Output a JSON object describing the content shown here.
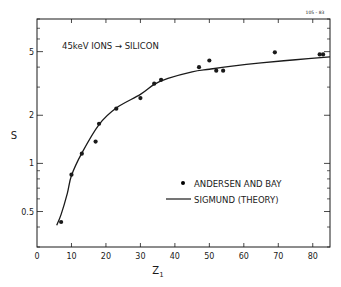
{
  "figure_id": "105 - 83",
  "chart_data": {
    "type": "scatter",
    "title": "45keV IONS → SILICON",
    "xlabel": "Z1",
    "ylabel": "S",
    "xlim": [
      0,
      85
    ],
    "ylim": [
      0.3,
      8
    ],
    "yscale": "log",
    "grid": false,
    "legend_position": "lower right",
    "x_ticks": [
      0,
      10,
      20,
      30,
      40,
      50,
      60,
      70,
      80
    ],
    "y_ticks": [
      0.5,
      1,
      2,
      5
    ],
    "series": [
      {
        "name": "ANDERSEN AND BAY",
        "kind": "points",
        "x": [
          7,
          10,
          13,
          17,
          18,
          23,
          30,
          34,
          36,
          47,
          50,
          52,
          54,
          69,
          82,
          83
        ],
        "y": [
          0.43,
          0.85,
          1.15,
          1.37,
          1.77,
          2.2,
          2.56,
          3.15,
          3.33,
          4.0,
          4.4,
          3.8,
          3.8,
          4.95,
          4.8,
          4.8
        ]
      },
      {
        "name": "SIGMUND (THEORY)",
        "kind": "line",
        "x": [
          5.7,
          7,
          8.8,
          10,
          13,
          18,
          23,
          30,
          34,
          38,
          45,
          50,
          56,
          65,
          75,
          85
        ],
        "y": [
          0.41,
          0.48,
          0.65,
          0.84,
          1.16,
          1.75,
          2.22,
          2.7,
          3.12,
          3.4,
          3.74,
          3.88,
          4.04,
          4.25,
          4.45,
          4.64
        ]
      }
    ]
  },
  "legend": {
    "items": [
      {
        "label": "ANDERSEN AND BAY",
        "symbol": "dot"
      },
      {
        "label": "SIGMUND (THEORY)",
        "symbol": "line"
      }
    ]
  },
  "colors": {
    "ink": "#1a1a1a",
    "background": "#ffffff"
  }
}
